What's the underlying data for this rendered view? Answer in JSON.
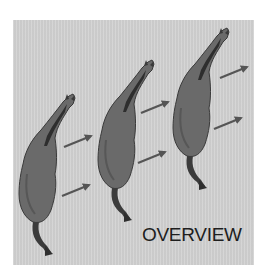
{
  "figure": {
    "label": "OVERVIEW",
    "colors": {
      "background_panel": "#d1d1d1",
      "horse_body": "#6a6a6a",
      "horse_outline": "#3a3a3a",
      "mane": "#2e2e2e",
      "arrow": "#555555",
      "label_text": "#1e1e1e"
    },
    "horses": [
      {
        "id": "horse-1",
        "position": "left"
      },
      {
        "id": "horse-2",
        "position": "middle"
      },
      {
        "id": "horse-3",
        "position": "right"
      }
    ],
    "arrows": [
      {
        "id": "arrow-1a",
        "direction": "up-right"
      },
      {
        "id": "arrow-1b",
        "direction": "up-right"
      },
      {
        "id": "arrow-2a",
        "direction": "up-right"
      },
      {
        "id": "arrow-2b",
        "direction": "up-right"
      },
      {
        "id": "arrow-3a",
        "direction": "up-right"
      },
      {
        "id": "arrow-3b",
        "direction": "up-right"
      }
    ]
  }
}
